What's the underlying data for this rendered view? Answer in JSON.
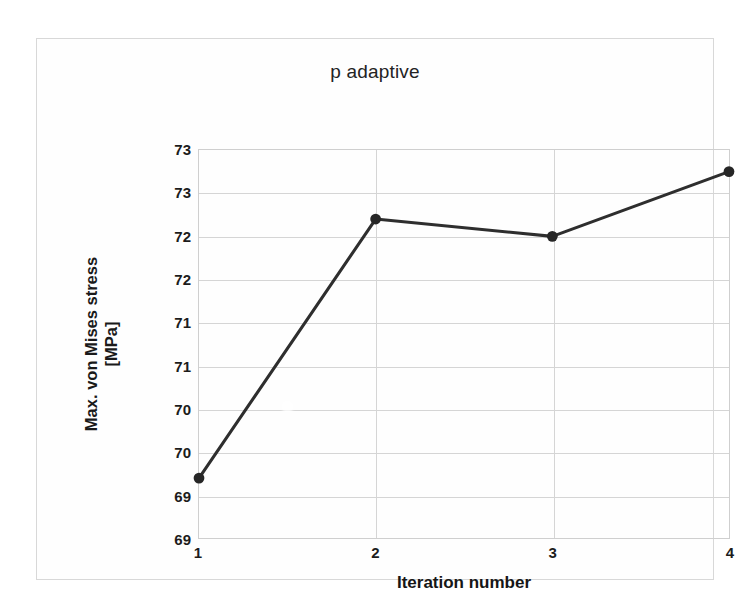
{
  "chart_data": {
    "type": "line",
    "title": "p adaptive",
    "xlabel": "Iteration number",
    "ylabel_lines": [
      "Max. von Mises stress",
      "[MPa]"
    ],
    "x": [
      1,
      2,
      3,
      4
    ],
    "values": [
      69.2,
      72.2,
      72.0,
      72.75
    ],
    "series": [
      {
        "name": "Max. von Mises stress",
        "values": [
          69.2,
          72.2,
          72.0,
          72.75
        ]
      }
    ],
    "xtick_labels": [
      "1",
      "2",
      "3",
      "4"
    ],
    "xlim": [
      1,
      4
    ],
    "ylim": [
      68.5,
      73.0
    ],
    "ytick_values": [
      73.0,
      72.5,
      72.0,
      71.5,
      71.0,
      70.5,
      70.0,
      69.5,
      69.0,
      68.5
    ],
    "ytick_labels": [
      "73",
      "73",
      "72",
      "72",
      "71",
      "71",
      "70",
      "70",
      "69",
      "69"
    ],
    "grid": true,
    "legend": "none",
    "line_color": "#2e2e2e",
    "marker_color": "#262626",
    "gridline_color": "#d5d5d5",
    "frame_color": "#cfcfcf"
  }
}
